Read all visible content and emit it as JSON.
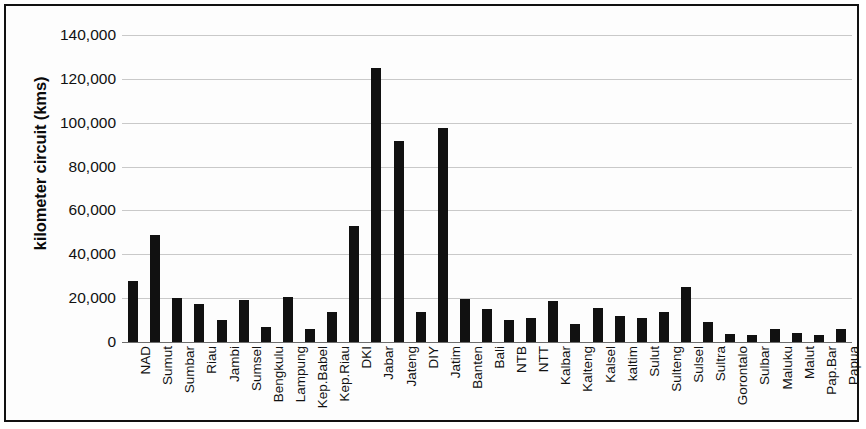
{
  "chart_data": {
    "type": "bar",
    "title": "",
    "xlabel": "",
    "ylabel": "kilometer circuit (kms)",
    "ylim": [
      0,
      140000
    ],
    "ytick_values": [
      0,
      20000,
      40000,
      60000,
      80000,
      100000,
      120000,
      140000
    ],
    "ytick_labels": [
      "0",
      "20,000",
      "40,000",
      "60,000",
      "80,000",
      "100,000",
      "120,000",
      "140,000"
    ],
    "grid": true,
    "legend": null,
    "bar_color": "#111111",
    "categories": [
      "NAD",
      "Sumut",
      "Sumbar",
      "Riau",
      "Jambi",
      "Sumsel",
      "Bengkulu",
      "Lampung",
      "Kep.Babel",
      "Kep.Riau",
      "DKI",
      "Jabar",
      "Jateng",
      "DIY",
      "Jatim",
      "Banten",
      "Bali",
      "NTB",
      "NTT",
      "Kalbar",
      "Kalteng",
      "Kalsel",
      "kaltim",
      "Sulut",
      "Sulteng",
      "Sulsel",
      "Sultra",
      "Gorontalo",
      "Sulbar",
      "Maluku",
      "Malut",
      "Pap.Bar",
      "Papua"
    ],
    "values": [
      28000,
      49000,
      20000,
      17500,
      10000,
      19000,
      7000,
      20500,
      6000,
      13500,
      53000,
      125000,
      91500,
      13500,
      97500,
      19500,
      15000,
      10000,
      11000,
      18500,
      8000,
      15500,
      12000,
      11000,
      13500,
      25000,
      9000,
      3500,
      3000,
      6000,
      4000,
      3000,
      6000
    ]
  }
}
